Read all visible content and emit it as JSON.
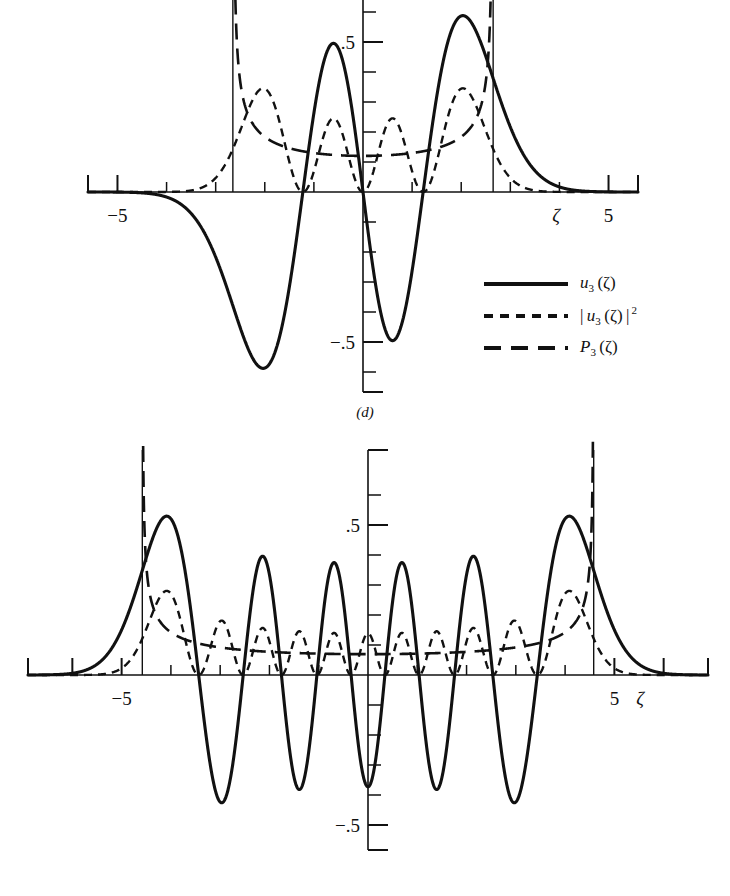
{
  "figure": {
    "type": "quantum-harmonic-oscillator-wavefunctions",
    "background_color": "#ffffff",
    "ink_color": "#111111"
  },
  "panels": [
    {
      "id": "d",
      "caption": "(d)",
      "quantum_number": 3,
      "axis": {
        "xlabel": "ζ",
        "x_ticks": [
          -5,
          -4,
          -3,
          -2,
          -1,
          0,
          1,
          2,
          3,
          4,
          5
        ],
        "x_tick_labels_shown": [
          "−5",
          "5"
        ],
        "x_label_left": "−5",
        "x_label_right": "5",
        "xlim": [
          -5.6,
          5.6
        ],
        "y_ticks": [
          -0.6,
          -0.5,
          -0.4,
          -0.3,
          -0.2,
          -0.1,
          0,
          0.1,
          0.2,
          0.3,
          0.4,
          0.5,
          0.6
        ],
        "y_tick_labels_shown": [
          ".5",
          "−.5"
        ],
        "y_label_positive": ".5",
        "y_label_negative": "−.5",
        "ylim": [
          -0.66,
          0.66
        ],
        "grid": false
      },
      "turning_points": [
        -2.65,
        2.65
      ],
      "legend": {
        "position": "right-below-axis",
        "entries": [
          {
            "style": "solid",
            "label_html": "<i>u</i><sub>3</sub> (ζ)",
            "symbol": "u_3(ζ)"
          },
          {
            "style": "short-dash",
            "label_html": "| <i>u</i><sub>3</sub> (ζ) |<sup> 2</sup>",
            "symbol": "|u_3(ζ)|^2"
          },
          {
            "style": "long-dash",
            "label_html": "<i>P</i><sub>3</sub> (ζ)",
            "symbol": "P_3(ζ)"
          }
        ]
      }
    },
    {
      "id": "e",
      "caption": "(e)",
      "quantum_number": 10,
      "axis": {
        "xlabel": "ζ",
        "x_ticks": [
          -6,
          -5,
          -4,
          -3,
          -2,
          -1,
          0,
          1,
          2,
          3,
          4,
          5,
          6
        ],
        "x_tick_labels_shown": [
          "−5",
          "5"
        ],
        "x_label_left": "−5",
        "x_label_right": "5",
        "xlim": [
          -6.9,
          6.9
        ],
        "y_ticks": [
          -0.6,
          -0.5,
          -0.4,
          -0.3,
          -0.2,
          -0.1,
          0,
          0.1,
          0.2,
          0.3,
          0.4,
          0.5,
          0.6
        ],
        "y_tick_labels_shown": [
          ".5",
          "−.5"
        ],
        "y_label_positive": ".5",
        "y_label_negative": "−.5",
        "ylim": [
          -0.66,
          0.66
        ],
        "grid": false
      },
      "turning_points": [
        -4.58,
        4.58
      ],
      "legend": {
        "position": "right-below-axis",
        "entries": [
          {
            "style": "solid",
            "label_html": "<i>u</i><sub>10</sub> (ζ)",
            "symbol": "u_10(ζ)"
          },
          {
            "style": "short-dash",
            "label_html": "| <i>u</i><sub>10</sub> (ζ) |<sup> 2</sup>",
            "symbol": "|u_10(ζ)|^2"
          },
          {
            "style": "long-dash",
            "label_html": "<i>P</i><sub>10</sub> (ζ)",
            "symbol": "P_10(ζ)"
          }
        ]
      }
    }
  ],
  "chart_data": [
    {
      "type": "line",
      "panel": "d",
      "title": "(d)",
      "xlabel": "ζ",
      "ylabel": "",
      "xlim": [
        -5.6,
        5.6
      ],
      "ylim": [
        -0.66,
        0.66
      ],
      "grid": false,
      "legend_position": "lower-right",
      "annotations": [
        {
          "kind": "vertical-line",
          "x": -2.65,
          "note": "classical turning point"
        },
        {
          "kind": "vertical-line",
          "x": 2.65,
          "note": "classical turning point"
        }
      ],
      "series": [
        {
          "name": "u_3(ζ)",
          "style": "solid",
          "zeros": [
            -1.2247,
            0,
            1.2247
          ],
          "extrema": [
            {
              "x": -3.0,
              "y": -0.6
            },
            {
              "x": -0.63,
              "y": 0.51
            },
            {
              "x": 0.63,
              "y": -0.51
            },
            {
              "x": 3.0,
              "y": 0.6
            }
          ],
          "x": [
            -5.6,
            -5.2,
            -4.8,
            -4.4,
            -4.0,
            -3.6,
            -3.2,
            -2.8,
            -2.4,
            -2.0,
            -1.6,
            -1.2,
            -0.8,
            -0.4,
            0.0,
            0.4,
            0.8,
            1.2,
            1.6,
            2.0,
            2.4,
            2.8,
            3.2,
            3.6,
            4.0,
            4.4,
            4.8,
            5.2,
            5.6
          ],
          "y": [
            -0.001,
            -0.004,
            -0.015,
            -0.047,
            -0.124,
            -0.272,
            -0.465,
            -0.601,
            -0.561,
            -0.33,
            -0.006,
            0.017,
            0.492,
            0.468,
            0.0,
            -0.468,
            -0.492,
            -0.017,
            0.006,
            0.33,
            0.561,
            0.601,
            0.465,
            0.272,
            0.124,
            0.047,
            0.015,
            0.004,
            0.001
          ]
        },
        {
          "name": "|u_3(ζ)|^2",
          "style": "short-dash",
          "extrema": [
            {
              "x": -3.0,
              "y": 0.36
            },
            {
              "x": -0.63,
              "y": 0.26
            },
            {
              "x": 0.63,
              "y": 0.26
            },
            {
              "x": 3.0,
              "y": 0.36
            }
          ],
          "x": [
            -5.6,
            -5.2,
            -4.8,
            -4.4,
            -4.0,
            -3.6,
            -3.2,
            -2.8,
            -2.4,
            -2.0,
            -1.6,
            -1.2,
            -0.8,
            -0.4,
            0.0,
            0.4,
            0.8,
            1.2,
            1.6,
            2.0,
            2.4,
            2.8,
            3.2,
            3.6,
            4.0,
            4.4,
            4.8,
            5.2,
            5.6
          ],
          "y": [
            0.0,
            0.0,
            0.0,
            0.002,
            0.015,
            0.074,
            0.216,
            0.361,
            0.315,
            0.109,
            0.0,
            0.0,
            0.242,
            0.219,
            0.0,
            0.219,
            0.242,
            0.0,
            0.0,
            0.109,
            0.315,
            0.361,
            0.216,
            0.074,
            0.015,
            0.002,
            0.0,
            0.0,
            0.0
          ]
        },
        {
          "name": "P_3(ζ)",
          "style": "long-dash",
          "note": "classical probability density, diverges at turning points ±2.65",
          "minimum": {
            "x": 0.0,
            "y": 0.115
          },
          "x": [
            -2.6,
            -2.5,
            -2.4,
            -2.2,
            -2.0,
            -1.6,
            -1.2,
            -0.8,
            -0.4,
            0.0,
            0.4,
            0.8,
            1.2,
            1.6,
            2.0,
            2.2,
            2.4,
            2.5,
            2.6
          ],
          "y": [
            0.52,
            0.37,
            0.3,
            0.23,
            0.19,
            0.15,
            0.131,
            0.122,
            0.117,
            0.115,
            0.117,
            0.122,
            0.131,
            0.15,
            0.19,
            0.23,
            0.3,
            0.37,
            0.52
          ]
        }
      ]
    },
    {
      "type": "line",
      "panel": "e",
      "title": "(e)",
      "xlabel": "ζ",
      "ylabel": "",
      "xlim": [
        -6.9,
        6.9
      ],
      "ylim": [
        -0.66,
        0.66
      ],
      "grid": false,
      "legend_position": "lower-right",
      "annotations": [
        {
          "kind": "vertical-line",
          "x": -4.58,
          "note": "classical turning point"
        },
        {
          "kind": "vertical-line",
          "x": 4.58,
          "note": "classical turning point"
        }
      ],
      "series": [
        {
          "name": "u_10(ζ)",
          "style": "solid",
          "zeros": [
            -3.4362,
            -2.5327,
            -1.7567,
            -1.0366,
            -0.3429,
            0.3429,
            1.0366,
            1.7567,
            2.5327,
            3.4362
          ],
          "extrema": [
            {
              "x": -4.1,
              "y": 0.55
            },
            {
              "x": -2.98,
              "y": -0.52
            },
            {
              "x": -2.15,
              "y": 0.43
            },
            {
              "x": -1.4,
              "y": -0.43
            },
            {
              "x": -0.69,
              "y": 0.43
            },
            {
              "x": 0.0,
              "y": -0.43
            },
            {
              "x": 0.69,
              "y": 0.43
            },
            {
              "x": 1.4,
              "y": -0.43
            },
            {
              "x": 2.15,
              "y": 0.43
            },
            {
              "x": 2.98,
              "y": -0.52
            },
            {
              "x": 4.1,
              "y": 0.55
            }
          ],
          "x": [
            -6.9,
            -6.4,
            -5.9,
            -5.4,
            -5.0,
            -4.6,
            -4.1,
            -3.7,
            -3.4,
            -3.0,
            -2.5,
            -2.15,
            -1.76,
            -1.4,
            -1.04,
            -0.69,
            -0.34,
            0.0,
            0.34,
            0.69,
            1.04,
            1.4,
            1.76,
            2.15,
            2.53,
            2.98,
            3.44,
            3.7,
            4.1,
            4.6,
            5.0,
            5.4,
            5.9,
            6.4,
            6.9
          ],
          "y": [
            0.0,
            0.001,
            0.005,
            0.05,
            0.19,
            0.43,
            0.55,
            0.29,
            0.0,
            -0.49,
            0.0,
            0.43,
            0.0,
            -0.43,
            0.0,
            0.43,
            0.0,
            -0.43,
            0.0,
            0.43,
            0.0,
            -0.43,
            0.0,
            0.43,
            0.0,
            -0.52,
            0.0,
            0.29,
            0.55,
            0.43,
            0.19,
            0.05,
            0.005,
            0.001,
            0.0
          ]
        },
        {
          "name": "|u_10(ζ)|^2",
          "style": "short-dash",
          "extrema": [
            {
              "x": -4.1,
              "y": 0.3
            },
            {
              "x": -2.98,
              "y": 0.16
            },
            {
              "x": -2.15,
              "y": 0.13
            },
            {
              "x": -1.4,
              "y": 0.12
            },
            {
              "x": -0.69,
              "y": 0.12
            },
            {
              "x": 0.0,
              "y": 0.12
            },
            {
              "x": 0.69,
              "y": 0.12
            },
            {
              "x": 1.4,
              "y": 0.12
            },
            {
              "x": 2.15,
              "y": 0.13
            },
            {
              "x": 2.98,
              "y": 0.16
            },
            {
              "x": 4.1,
              "y": 0.3
            }
          ],
          "x": [
            -6.9,
            -6.4,
            -5.9,
            -5.4,
            -5.0,
            -4.6,
            -4.1,
            -3.7,
            -3.4,
            -3.0,
            -2.5,
            -2.15,
            -1.76,
            -1.4,
            -1.04,
            -0.69,
            -0.34,
            0.0,
            0.34,
            0.69,
            1.04,
            1.4,
            1.76,
            2.15,
            2.53,
            2.98,
            3.44,
            3.7,
            4.1,
            4.6,
            5.0,
            5.4,
            5.9,
            6.4,
            6.9
          ],
          "y": [
            0.0,
            0.0,
            0.0,
            0.003,
            0.036,
            0.185,
            0.3,
            0.084,
            0.0,
            0.16,
            0.0,
            0.13,
            0.0,
            0.12,
            0.0,
            0.12,
            0.0,
            0.12,
            0.0,
            0.12,
            0.0,
            0.12,
            0.0,
            0.13,
            0.0,
            0.16,
            0.0,
            0.084,
            0.3,
            0.185,
            0.036,
            0.003,
            0.0,
            0.0,
            0.0
          ]
        },
        {
          "name": "P_10(ζ)",
          "style": "long-dash",
          "note": "classical probability density, diverges at turning points ±4.58",
          "minimum": {
            "x": 0.0,
            "y": 0.068
          },
          "x": [
            -4.52,
            -4.4,
            -4.2,
            -4.0,
            -3.6,
            -3.2,
            -2.8,
            -2.4,
            -2.0,
            -1.5,
            -1.0,
            -0.5,
            0.0,
            0.5,
            1.0,
            1.5,
            2.0,
            2.4,
            2.8,
            3.2,
            3.6,
            4.0,
            4.2,
            4.4,
            4.52
          ],
          "y": [
            0.42,
            0.3,
            0.225,
            0.182,
            0.137,
            0.115,
            0.101,
            0.091,
            0.084,
            0.077,
            0.072,
            0.069,
            0.068,
            0.069,
            0.072,
            0.077,
            0.084,
            0.091,
            0.101,
            0.115,
            0.137,
            0.182,
            0.225,
            0.3,
            0.42
          ]
        }
      ]
    }
  ]
}
